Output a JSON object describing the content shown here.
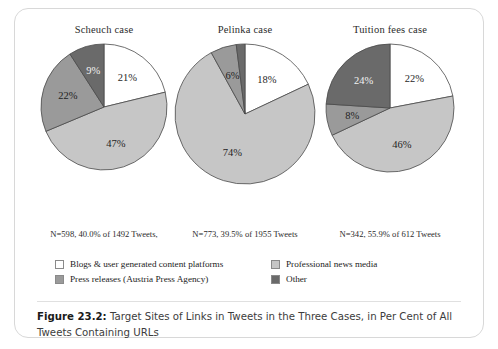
{
  "figure": {
    "caption_label": "Figure 23.2:",
    "caption_text": " Target Sites of Links in Tweets in the Three Cases, in Per Cent of All Tweets Containing URLs"
  },
  "legend": {
    "items": [
      {
        "label": "Blogs & user generated content platforms",
        "color": "#ffffff"
      },
      {
        "label": "Professional news media",
        "color": "#c6c6c6"
      },
      {
        "label": "Press releases (Austria Press Agency)",
        "color": "#9a9a9a"
      },
      {
        "label": "Other",
        "color": "#6a6a6a"
      }
    ]
  },
  "colors": {
    "blogs": "#ffffff",
    "news": "#c6c6c6",
    "press": "#9a9a9a",
    "other": "#6a6a6a",
    "outline": "#4a4a4a"
  },
  "chart_data": [
    {
      "type": "pie",
      "title": "Scheuch case",
      "categories": [
        "Blogs & user generated content platforms",
        "Professional news media",
        "Press releases (Austria Press Agency)",
        "Other"
      ],
      "values": [
        21,
        47,
        22,
        9
      ],
      "labels": [
        "21%",
        "47%",
        "22%",
        "9%"
      ],
      "note": "N=598, 40.0% of 1492 Tweets,"
    },
    {
      "type": "pie",
      "title": "Pelinka case",
      "categories": [
        "Blogs & user generated content platforms",
        "Professional news media",
        "Press releases (Austria Press Agency)",
        "Other"
      ],
      "values": [
        18,
        74,
        6,
        2
      ],
      "labels": [
        "18%",
        "74%",
        "6%",
        ""
      ],
      "note": "N=773, 39.5% of 1955 Tweets"
    },
    {
      "type": "pie",
      "title": "Tuition fees case",
      "categories": [
        "Blogs & user generated content platforms",
        "Professional news media",
        "Press releases (Austria Press Agency)",
        "Other"
      ],
      "values": [
        22,
        46,
        8,
        24
      ],
      "labels": [
        "22%",
        "46%",
        "8%",
        "24%"
      ],
      "note": "N=342, 55.9% of 612 Tweets"
    }
  ]
}
